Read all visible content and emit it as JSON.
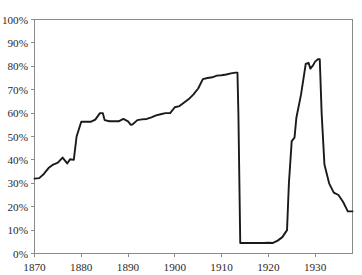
{
  "chart_data": {
    "type": "line",
    "title": "",
    "xlabel": "",
    "ylabel": "",
    "xlim": [
      1870,
      1938
    ],
    "ylim": [
      0,
      100
    ],
    "grid": false,
    "legend": null,
    "y_tick_labels": [
      "0%",
      "10%",
      "20%",
      "30%",
      "40%",
      "50%",
      "60%",
      "70%",
      "80%",
      "90%",
      "100%"
    ],
    "y_tick_values": [
      0,
      10,
      20,
      30,
      40,
      50,
      60,
      70,
      80,
      90,
      100
    ],
    "x_tick_labels": [
      "1870",
      "1880",
      "1890",
      "1900",
      "1910",
      "1920",
      "1930"
    ],
    "x_tick_values": [
      1870,
      1880,
      1890,
      1900,
      1910,
      1920,
      1930
    ],
    "series": [
      {
        "name": "share",
        "color": "#1a1a1a",
        "x": [
          1870,
          1871,
          1872,
          1873,
          1874,
          1875,
          1876,
          1877,
          1877.6,
          1878.4,
          1879,
          1880,
          1881,
          1882,
          1883,
          1884,
          1884.6,
          1885,
          1886,
          1887,
          1888,
          1889,
          1890,
          1890.6,
          1891,
          1892,
          1893,
          1894,
          1895,
          1896,
          1897,
          1898,
          1899,
          1900,
          1901,
          1902,
          1903,
          1904,
          1905,
          1906,
          1907,
          1908,
          1909,
          1910,
          1911,
          1912,
          1913,
          1913.4,
          1913.6,
          1914,
          1915,
          1916,
          1917,
          1918,
          1919,
          1920,
          1921,
          1922,
          1923,
          1924,
          1924.4,
          1925,
          1925.6,
          1926,
          1927,
          1928,
          1928.6,
          1929,
          1929.6,
          1930,
          1930.6,
          1931,
          1931.4,
          1932,
          1933,
          1934,
          1935,
          1936,
          1937,
          1938
        ],
        "y": [
          32.0,
          32.2,
          34.0,
          36.5,
          38.0,
          38.8,
          41.0,
          38.5,
          40.3,
          40.0,
          50.0,
          56.3,
          56.3,
          56.3,
          57.2,
          60.0,
          60.0,
          57.0,
          56.5,
          56.5,
          56.5,
          57.5,
          56.5,
          55.0,
          55.2,
          57.0,
          57.3,
          57.5,
          58.2,
          59.0,
          59.5,
          60.0,
          60.0,
          62.5,
          63.0,
          64.5,
          66.0,
          68.0,
          70.5,
          74.5,
          75.0,
          75.3,
          76.0,
          76.2,
          76.5,
          77.0,
          77.3,
          77.3,
          60.0,
          4.5,
          4.5,
          4.5,
          4.5,
          4.5,
          4.5,
          4.6,
          4.5,
          5.5,
          7.0,
          10.0,
          30.0,
          48.0,
          49.5,
          58.0,
          68.0,
          81.0,
          81.5,
          79.0,
          80.5,
          82.0,
          83.0,
          83.0,
          60.0,
          38.0,
          30.0,
          26.0,
          25.0,
          22.0,
          18.0,
          18.0
        ]
      }
    ]
  },
  "axes": {
    "y_axis_name": "percent-axis",
    "x_axis_name": "year-axis"
  }
}
